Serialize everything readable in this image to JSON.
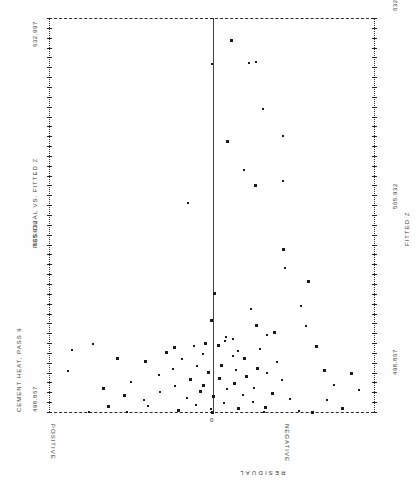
{
  "chart_data": {
    "type": "scatter",
    "title": "RESIDUAL VS. FITTED Z",
    "subtitle": "CEMENT HEAT, PASS 9",
    "xlabel": "RESIDUAL",
    "ylabel": "FITTED Z",
    "grid": false,
    "legend": null,
    "orientation": "rotated-90",
    "x_axis": {
      "label": "RESIDUAL",
      "left_side_label": "POSITIVE",
      "right_side_label": "NEGATIVE",
      "zero_label": "0",
      "zero_position_fraction": 0.505
    },
    "y_axis": {
      "label": "FITTED Z",
      "min": 498.867,
      "mid": 565.932,
      "max": 632.997,
      "min_label": "498.867",
      "mid_label": "565.932",
      "max_label": "632.997",
      "tick_count": 41
    },
    "points": [
      {
        "x": 0.56,
        "y": 625.5
      },
      {
        "x": 0.636,
        "y": 618.0
      },
      {
        "x": 0.614,
        "y": 617.8
      },
      {
        "x": 0.503,
        "y": 617.4
      },
      {
        "x": 0.657,
        "y": 601.9
      },
      {
        "x": 0.721,
        "y": 592.7
      },
      {
        "x": 0.548,
        "y": 591.0
      },
      {
        "x": 0.6,
        "y": 581.1
      },
      {
        "x": 0.719,
        "y": 577.4
      },
      {
        "x": 0.634,
        "y": 576.2
      },
      {
        "x": 0.427,
        "y": 570.0
      },
      {
        "x": 0.719,
        "y": 554.5
      },
      {
        "x": 0.726,
        "y": 548.0
      },
      {
        "x": 0.796,
        "y": 543.4
      },
      {
        "x": 0.508,
        "y": 539.5
      },
      {
        "x": 0.62,
        "y": 533.9
      },
      {
        "x": 0.497,
        "y": 530.2
      },
      {
        "x": 0.638,
        "y": 528.5
      },
      {
        "x": 0.693,
        "y": 526.2
      },
      {
        "x": 0.67,
        "y": 525.0
      },
      {
        "x": 0.544,
        "y": 524.4
      },
      {
        "x": 0.565,
        "y": 523.6
      },
      {
        "x": 0.543,
        "y": 522.9
      },
      {
        "x": 0.481,
        "y": 522.4
      },
      {
        "x": 0.519,
        "y": 521.6
      },
      {
        "x": 0.447,
        "y": 521.2
      },
      {
        "x": 0.384,
        "y": 520.9
      },
      {
        "x": 0.65,
        "y": 520.4
      },
      {
        "x": 0.583,
        "y": 519.8
      },
      {
        "x": 0.36,
        "y": 519.2
      },
      {
        "x": 0.474,
        "y": 518.7
      },
      {
        "x": 0.566,
        "y": 518.0
      },
      {
        "x": 0.601,
        "y": 517.4
      },
      {
        "x": 0.41,
        "y": 516.9
      },
      {
        "x": 0.296,
        "y": 516.2
      },
      {
        "x": 0.7,
        "y": 515.8
      },
      {
        "x": 0.53,
        "y": 515.0
      },
      {
        "x": 0.455,
        "y": 514.5
      },
      {
        "x": 0.641,
        "y": 514.0
      },
      {
        "x": 0.383,
        "y": 513.6
      },
      {
        "x": 0.575,
        "y": 513.1
      },
      {
        "x": 0.49,
        "y": 512.6
      },
      {
        "x": 0.672,
        "y": 512.0
      },
      {
        "x": 0.338,
        "y": 511.6
      },
      {
        "x": 0.606,
        "y": 511.1
      },
      {
        "x": 0.522,
        "y": 510.5
      },
      {
        "x": 0.435,
        "y": 510.0
      },
      {
        "x": 0.718,
        "y": 509.6
      },
      {
        "x": 0.251,
        "y": 509.1
      },
      {
        "x": 0.568,
        "y": 508.7
      },
      {
        "x": 0.473,
        "y": 508.2
      },
      {
        "x": 0.388,
        "y": 507.7
      },
      {
        "x": 0.63,
        "y": 507.2
      },
      {
        "x": 0.549,
        "y": 506.7
      },
      {
        "x": 0.466,
        "y": 506.1
      },
      {
        "x": 0.34,
        "y": 505.7
      },
      {
        "x": 0.687,
        "y": 505.2
      },
      {
        "x": 0.596,
        "y": 504.8
      },
      {
        "x": 0.505,
        "y": 504.3
      },
      {
        "x": 0.425,
        "y": 503.8
      },
      {
        "x": 0.741,
        "y": 503.3
      },
      {
        "x": 0.291,
        "y": 502.9
      },
      {
        "x": 0.627,
        "y": 502.4
      },
      {
        "x": 0.538,
        "y": 501.9
      },
      {
        "x": 0.452,
        "y": 501.4
      },
      {
        "x": 0.18,
        "y": 501.0
      },
      {
        "x": 0.666,
        "y": 500.6
      },
      {
        "x": 0.583,
        "y": 500.2
      },
      {
        "x": 0.497,
        "y": 499.8
      },
      {
        "x": 0.398,
        "y": 499.5
      },
      {
        "x": 0.77,
        "y": 499.2
      },
      {
        "x": 0.124,
        "y": 499.0
      },
      {
        "x": 0.82,
        "y": 521.5
      },
      {
        "x": 0.845,
        "y": 513.2
      },
      {
        "x": 0.878,
        "y": 508.0
      },
      {
        "x": 0.856,
        "y": 503.1
      },
      {
        "x": 0.9,
        "y": 500.2
      },
      {
        "x": 0.93,
        "y": 512.0
      },
      {
        "x": 0.955,
        "y": 506.4
      },
      {
        "x": 0.21,
        "y": 517.3
      },
      {
        "x": 0.134,
        "y": 521.9
      },
      {
        "x": 0.072,
        "y": 520.0
      },
      {
        "x": 0.058,
        "y": 512.7
      },
      {
        "x": 0.166,
        "y": 506.9
      },
      {
        "x": 0.232,
        "y": 504.6
      },
      {
        "x": 0.305,
        "y": 500.8
      },
      {
        "x": 0.774,
        "y": 535.0
      },
      {
        "x": 0.79,
        "y": 528.2
      },
      {
        "x": 0.81,
        "y": 498.9
      },
      {
        "x": 0.5,
        "y": 498.9
      },
      {
        "x": 0.66,
        "y": 498.9
      },
      {
        "x": 0.24,
        "y": 498.9
      }
    ]
  },
  "labels": {
    "title": "RESIDUAL VS. FITTED Z",
    "subtitle": "CEMENT HEAT, PASS 9",
    "ymax": "632.997",
    "ymid": "565.932",
    "ymin": "498.867",
    "ymax_right": "632.997",
    "ymid_right": "565.932",
    "ymin_right": "498.867",
    "axis_right": "FITTED Z",
    "positive": "POSITIVE",
    "negative": "NEGATIVE",
    "zero": "0",
    "xaxis": "RESIDUAL"
  }
}
